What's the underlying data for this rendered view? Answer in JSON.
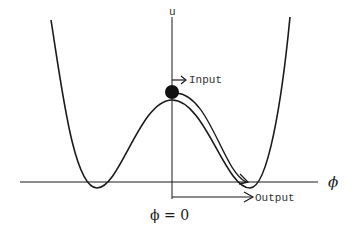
{
  "diagram": {
    "type": "double-well potential",
    "axes": {
      "vertical_label": "u",
      "horizontal_label": "ϕ",
      "origin_label": "ϕ = 0"
    },
    "annotations": {
      "input_label": "Input",
      "output_label": "Output"
    },
    "elements": {
      "ball": "state at unstable maximum",
      "path_arrow": "trajectory from peak to right minimum"
    },
    "colors": {
      "line": "#1a1a1a",
      "background": "#ffffff",
      "ball": "#111111"
    }
  }
}
